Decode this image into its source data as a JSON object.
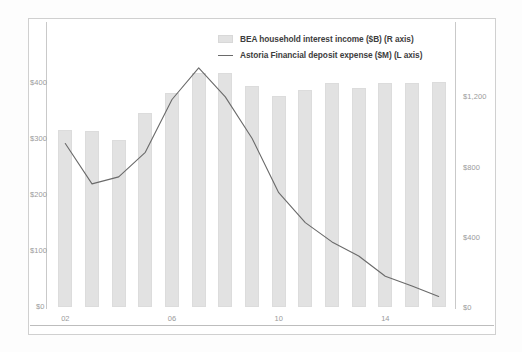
{
  "legend": {
    "items": [
      {
        "label": "BEA household interest income ($B) (R axis)",
        "marker": "bar-swatch",
        "color": "#e2e2e2"
      },
      {
        "label": "Astoria Financial deposit expense ($M) (L axis)",
        "marker": "line-swatch",
        "color": "#6a6a6a"
      }
    ]
  },
  "axes": {
    "left": {
      "ticks": [
        "$400",
        "$300",
        "$200",
        "$100",
        "$0"
      ]
    },
    "right": {
      "ticks": [
        "$1,200",
        "$800",
        "$400",
        "$0"
      ]
    },
    "bottom": {
      "ticks": [
        "02",
        "06",
        "10",
        "14"
      ]
    }
  },
  "chart_data": {
    "type": "bar",
    "title": "",
    "subtitle": "",
    "xlabel": "",
    "ylabel": "",
    "grid": false,
    "legend_position": "top-right",
    "categories": [
      "02",
      "03",
      "04",
      "05",
      "06",
      "07",
      "08",
      "09",
      "10",
      "11",
      "12",
      "13",
      "14",
      "15",
      "16"
    ],
    "axis_left": {
      "label": "$B",
      "ticks": [
        0,
        100,
        200,
        300,
        400
      ],
      "tick_labels": [
        "$0",
        "$100",
        "$200",
        "$300",
        "$400"
      ],
      "ylim": [
        0,
        440
      ]
    },
    "axis_right": {
      "label": "$M",
      "ticks": [
        0,
        400,
        800,
        1200
      ],
      "tick_labels": [
        "$0",
        "$400",
        "$800",
        "$1,200"
      ],
      "ylim": [
        0,
        1350
      ]
    },
    "series": [
      {
        "name": "BEA household interest income ($B) (R axis)",
        "type": "bar",
        "axis": "left",
        "color": "#e2e2e2",
        "values": [
          315,
          313,
          297,
          345,
          380,
          416,
          416,
          393,
          375,
          386,
          398,
          389,
          398,
          398,
          400
        ]
      },
      {
        "name": "Astoria Financial deposit expense ($M) (L axis)",
        "type": "line",
        "axis": "right",
        "color": "#6a6a6a",
        "values": [
          930,
          700,
          740,
          880,
          1180,
          1360,
          1195,
          960,
          650,
          480,
          370,
          290,
          175,
          120,
          60
        ]
      }
    ]
  }
}
